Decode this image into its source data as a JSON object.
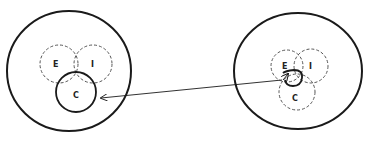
{
  "left": {
    "labels": {
      "e": "E",
      "i": "I",
      "c": "C"
    }
  },
  "right": {
    "labels": {
      "e": "E",
      "i": "I",
      "c": "C"
    }
  },
  "colors": {
    "stroke": "#1a1a1a",
    "dashed": "#555555",
    "background": "#ffffff"
  }
}
